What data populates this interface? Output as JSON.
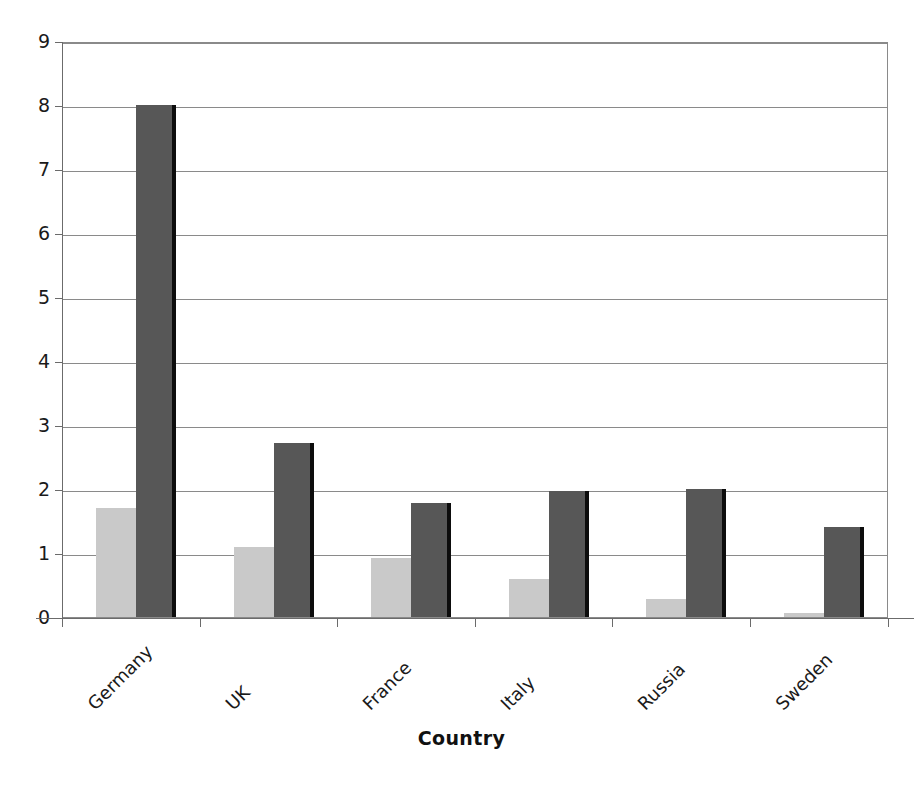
{
  "chart_data": {
    "type": "bar",
    "title": "",
    "subtitle": "",
    "xlabel": "Country",
    "ylabel": "",
    "categories": [
      "Germany",
      "UK",
      "France",
      "Italy",
      "Russia",
      "Sweden"
    ],
    "series": [
      {
        "name": "Series 1",
        "color": "#c9c9c9",
        "values": [
          1.7,
          1.09,
          0.92,
          0.59,
          0.28,
          0.06
        ]
      },
      {
        "name": "Series 2",
        "color": "#575757",
        "values": [
          8.0,
          2.72,
          1.78,
          1.97,
          2.0,
          1.41
        ]
      }
    ],
    "ylim": [
      0,
      9
    ],
    "ytick_labels": [
      "0",
      "1",
      "2",
      "3",
      "4",
      "5",
      "6",
      "7",
      "8",
      "9"
    ],
    "ytick_values": [
      0,
      1,
      2,
      3,
      4,
      5,
      6,
      7,
      8,
      9
    ],
    "grid": "horizontal",
    "legend": "none",
    "xtick_label_rotation": 45,
    "plot_border": true,
    "background_color": "#ffffff",
    "axis_color": "#8a8a8a"
  }
}
